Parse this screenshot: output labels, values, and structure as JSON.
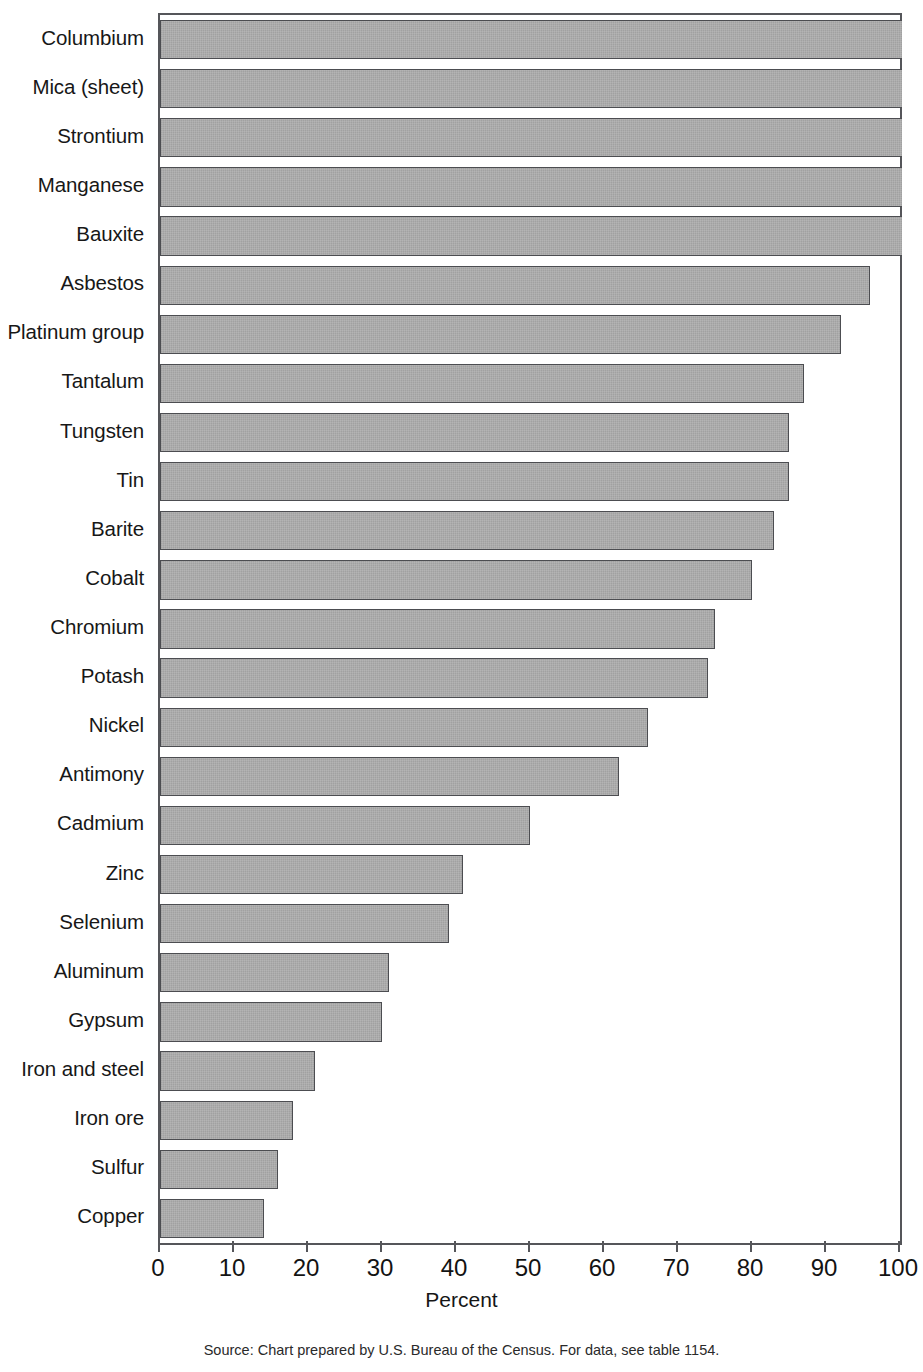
{
  "chart_data": {
    "type": "bar",
    "orientation": "horizontal",
    "title": "",
    "xlabel": "Percent",
    "ylabel": "",
    "xlim": [
      0,
      100
    ],
    "xticks": [
      0,
      10,
      20,
      30,
      40,
      50,
      60,
      70,
      80,
      90,
      100
    ],
    "xtick_labels": [
      "0",
      "10",
      "20",
      "30",
      "40",
      "50",
      "60",
      "70",
      "80",
      "90",
      "100"
    ],
    "grid": false,
    "legend": null,
    "bar_color": "#a8a8a8",
    "bar_edge_color": "#4c4d51",
    "categories": [
      "Columbium",
      "Mica (sheet)",
      "Strontium",
      "Manganese",
      "Bauxite",
      "Asbestos",
      "Platinum group",
      "Tantalum",
      "Tungsten",
      "Tin",
      "Barite",
      "Cobalt",
      "Chromium",
      "Potash",
      "Nickel",
      "Antimony",
      "Cadmium",
      "Zinc",
      "Selenium",
      "Aluminum",
      "Gypsum",
      "Iron and steel",
      "Iron ore",
      "Sulfur",
      "Copper"
    ],
    "values": [
      100,
      100,
      100,
      100,
      100,
      96,
      92,
      87,
      85,
      85,
      83,
      80,
      75,
      74,
      66,
      62,
      50,
      41,
      39,
      31,
      30,
      21,
      18,
      16,
      14
    ],
    "annotations": []
  },
  "axis": {
    "title": "Percent"
  },
  "footer": {
    "source": "Source: Chart prepared by U.S. Bureau of the Census. For data, see table 1154."
  }
}
